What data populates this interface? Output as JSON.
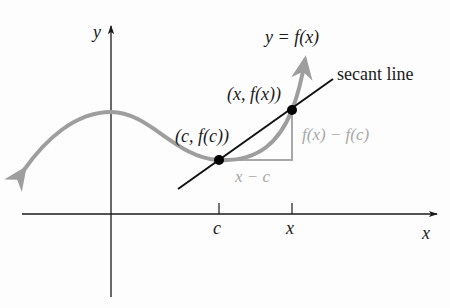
{
  "diagram": {
    "axes": {
      "x_label": "x",
      "y_label": "y",
      "ticks": [
        {
          "label": "c",
          "px": 219
        },
        {
          "label": "x",
          "px": 292
        }
      ]
    },
    "curve_label": {
      "italic_part": "y",
      "eq": " = ",
      "fn": "f(x)",
      "text": "y = f(x)"
    },
    "secant_label": "secant line",
    "points": [
      {
        "name": "c-point",
        "label": "(c, f(c))"
      },
      {
        "name": "x-point",
        "label": "(x, f(x))"
      }
    ],
    "rise_label": "f(x) − f(c)",
    "run_label": "x − c",
    "colors": {
      "axis": "#1a1a1a",
      "curve": "#9e9e9e",
      "secant": "#111111",
      "triangle": "#a8a8a8",
      "point": "#000000"
    }
  }
}
